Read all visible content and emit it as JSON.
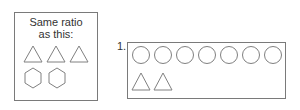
{
  "reference": {
    "title_line1": "Same ratio",
    "title_line2": "as this:",
    "triangles": 3,
    "hexagons": 2
  },
  "problem": {
    "number_label": "1.",
    "circles": 7,
    "triangles": 2
  },
  "colors": {
    "stroke": "#808080",
    "border": "#7a7a7a",
    "text": "#333333"
  }
}
